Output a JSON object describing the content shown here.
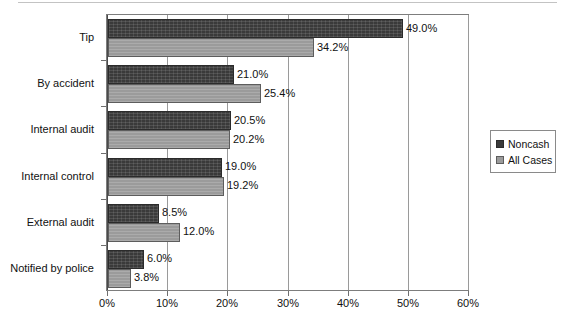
{
  "chart_data": {
    "type": "bar",
    "orientation": "horizontal",
    "title": "",
    "subtitle": "",
    "xlabel": "",
    "ylabel": "",
    "xlim": [
      0,
      60
    ],
    "xticks": [
      "0%",
      "10%",
      "20%",
      "30%",
      "40%",
      "50%",
      "60%"
    ],
    "xtick_values": [
      0,
      10,
      20,
      30,
      40,
      50,
      60
    ],
    "grid": true,
    "grid_axis": "x",
    "legend_position": "right",
    "categories": [
      "Tip",
      "By accident",
      "Internal audit",
      "Internal control",
      "External audit",
      "Notified by police"
    ],
    "series": [
      {
        "name": "Noncash",
        "color": "#3a3a3a",
        "values": [
          49.0,
          21.0,
          20.5,
          19.0,
          8.5,
          6.0
        ],
        "labels": [
          "49.0%",
          "21.0%",
          "20.5%",
          "19.0%",
          "8.5%",
          "6.0%"
        ]
      },
      {
        "name": "All Cases",
        "color": "#9b9b9b",
        "values": [
          34.2,
          25.4,
          20.2,
          19.2,
          12.0,
          3.8
        ],
        "labels": [
          "34.2%",
          "25.4%",
          "20.2%",
          "19.2%",
          "12.0%",
          "3.8%"
        ]
      }
    ]
  },
  "legend": {
    "entries": [
      {
        "label": "Noncash",
        "color": "#3a3a3a"
      },
      {
        "label": "All Cases",
        "color": "#9b9b9b"
      }
    ]
  },
  "colors": {
    "noncash": "#3a3a3a",
    "all_cases": "#9b9b9b",
    "axis": "#4a4a4a",
    "grid": "#9a9a9a",
    "frame": "#7d7d7d",
    "text": "#111111",
    "background": "#ffffff"
  }
}
